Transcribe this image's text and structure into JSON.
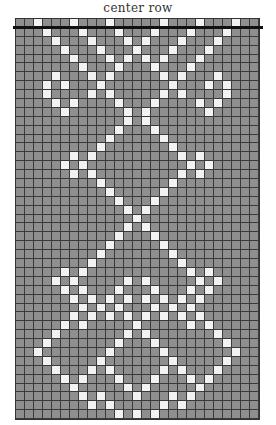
{
  "title": "center row",
  "grid": {
    "cols": 27,
    "rows": 45,
    "colors": {
      "off": "#8f8f8f",
      "on": "#f2f2f2",
      "line": "#3a3a3a",
      "center_line": "#111111"
    },
    "center_row_after": 0,
    "on_cells": {
      "0": [
        2,
        6,
        10,
        16,
        20,
        24
      ],
      "1": [
        3,
        7,
        11,
        15,
        19,
        23
      ],
      "2": [
        4,
        8,
        12,
        14,
        18,
        22
      ],
      "3": [
        5,
        9,
        13,
        17,
        21
      ],
      "4": [
        6,
        10,
        12,
        14,
        16,
        20
      ],
      "5": [
        7,
        11,
        15,
        19
      ],
      "6": [
        4,
        8,
        10,
        16,
        18,
        22
      ],
      "7": [
        3,
        5,
        9,
        17,
        21,
        23
      ],
      "8": [
        3,
        8,
        10,
        16,
        18,
        23
      ],
      "9": [
        4,
        6,
        11,
        15,
        20,
        22
      ],
      "10": [
        5,
        12,
        14,
        21
      ],
      "11": [
        12,
        14
      ],
      "12": [
        11,
        15
      ],
      "13": [
        10,
        16
      ],
      "14": [
        9,
        17
      ],
      "15": [
        6,
        8,
        18,
        20
      ],
      "16": [
        5,
        7,
        19,
        21
      ],
      "17": [
        6,
        8,
        18,
        20
      ],
      "18": [
        9,
        17
      ],
      "19": [
        10,
        16
      ],
      "20": [
        11,
        15
      ],
      "21": [
        12,
        14
      ],
      "22": [
        13
      ],
      "23": [
        12,
        14
      ],
      "24": [
        11,
        15
      ],
      "25": [
        10,
        16
      ],
      "26": [
        9,
        17
      ],
      "27": [
        8,
        18
      ],
      "28": [
        5,
        7,
        19,
        21
      ],
      "29": [
        4,
        6,
        12,
        14,
        20,
        22
      ],
      "30": [
        5,
        7,
        11,
        15,
        19,
        21
      ],
      "31": [
        6,
        8,
        10,
        12,
        14,
        16,
        18,
        20
      ],
      "32": [
        7,
        9,
        11,
        15,
        17,
        19
      ],
      "33": [
        6,
        8,
        10,
        12,
        14,
        16,
        18,
        20
      ],
      "34": [
        5,
        7,
        13,
        19,
        21
      ],
      "35": [
        4,
        12,
        14,
        22
      ],
      "36": [
        3,
        11,
        15,
        23
      ],
      "37": [
        2,
        10,
        16,
        24
      ],
      "38": [
        3,
        9,
        17,
        23
      ],
      "39": [
        4,
        8,
        10,
        16,
        18,
        22
      ],
      "40": [
        5,
        7,
        11,
        15,
        19,
        21
      ],
      "41": [
        6,
        12,
        14,
        20
      ],
      "42": [
        7,
        9,
        13,
        17,
        19
      ],
      "43": [
        8,
        10,
        16,
        18
      ],
      "44": [
        11,
        13,
        15
      ]
    }
  }
}
